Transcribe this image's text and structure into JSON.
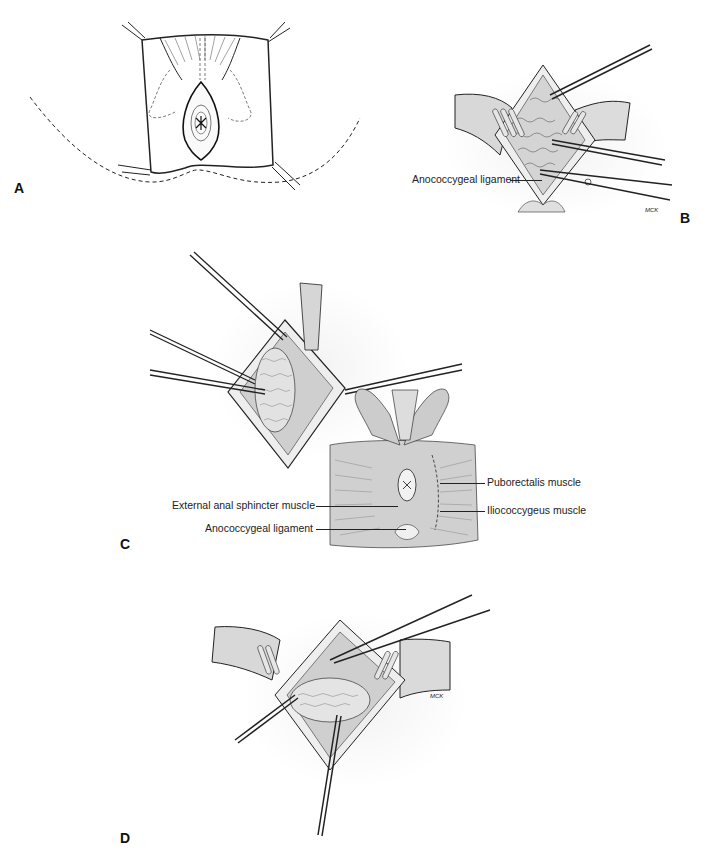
{
  "figure": {
    "panels": [
      {
        "id": "A",
        "letter": "A",
        "description": "Perineal elliptical skin incision outlined around anus, patient in prone jackknife position with buttocks taped apart"
      },
      {
        "id": "B",
        "letter": "B",
        "description": "Retractors in place, dissection of anococcygeal ligament with scissors and clamps",
        "labels": [
          "Anococcygeal ligament"
        ],
        "signature": "MCK"
      },
      {
        "id": "C",
        "letter": "C",
        "description": "Clamps applied to incised wound edges exposing rectum; inset anatomical view of pelvic floor musculature",
        "labels": [
          "Puborectalis muscle",
          "Iliococcygeus muscle",
          "External anal sphincter muscle",
          "Anococcygeal ligament"
        ]
      },
      {
        "id": "D",
        "letter": "D",
        "description": "Retractors spreading wound with instruments dividing levator muscles around rectum",
        "signature": "MCK"
      }
    ],
    "labels": {
      "b_anococcygeal": "Anococcygeal ligament",
      "c_puborectalis": "Puborectalis muscle",
      "c_iliococcygeus": "Iliococcygeus muscle",
      "c_external_sphincter": "External anal sphincter muscle",
      "c_anococcygeal": "Anococcygeal ligament"
    },
    "letters": {
      "a": "A",
      "b": "B",
      "c": "C",
      "d": "D"
    },
    "signatures": {
      "b": "MCK",
      "d": "MCK"
    },
    "colors": {
      "ink": "#1a1a1a",
      "tissue_gray": "#c9c9c9",
      "retractor_gray": "#d8d8d8",
      "paper": "#ffffff"
    }
  }
}
